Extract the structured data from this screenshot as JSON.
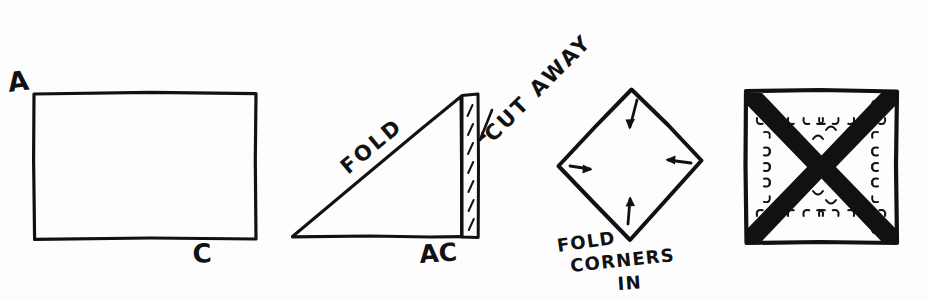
{
  "document": {
    "title": "Hand-drawn paper folding instruction sketch",
    "medium": "pen on white paper",
    "background_color": "#fdfdfd",
    "ink_color": "#111111",
    "width": 928,
    "height": 301,
    "panel_count": 4
  },
  "panels": [
    {
      "index": 1,
      "name": "rectangle-start",
      "shape": "rectangle",
      "description": "Plain rectangle of paper with corners labelled",
      "labels": [
        {
          "id": "label-a",
          "text": "A",
          "position": "top-left-outside"
        },
        {
          "id": "label-c",
          "text": "C",
          "position": "bottom-center-outside"
        }
      ]
    },
    {
      "index": 2,
      "name": "triangle-fold",
      "shape": "right-triangle",
      "description": "Rectangle folded on the diagonal forming a triangle with a leftover strip",
      "labels": [
        {
          "id": "label-fold",
          "text": "FOLD",
          "position": "along-hypotenuse",
          "rotation_deg": -40
        },
        {
          "id": "label-ac",
          "text": "AC",
          "position": "bottom-right-outside"
        },
        {
          "id": "label-cut-away",
          "text": "CUT AWAY",
          "position": "upper-right-diagonal",
          "rotation_deg": -45
        }
      ],
      "strip": {
        "name": "cut-away-strip",
        "hatching": "diagonal dashes",
        "dash_count": 7
      },
      "arrow": {
        "name": "cut-away-arrow",
        "points_to": "strip",
        "direction": "down-left"
      }
    },
    {
      "index": 3,
      "name": "diamond-fold-corners",
      "shape": "diamond",
      "description": "Square rotated 45 degrees with four arrows pointing inward",
      "labels": [
        {
          "id": "label-fold-line-1",
          "text": "FOLD",
          "rotation_deg": -8
        },
        {
          "id": "label-fold-line-2",
          "text": "CORNERS",
          "rotation_deg": -6
        },
        {
          "id": "label-fold-line-3",
          "text": "IN",
          "rotation_deg": -4
        }
      ],
      "arrows": [
        {
          "name": "arrow-top",
          "direction": "down",
          "at_vertex": "top"
        },
        {
          "name": "arrow-right",
          "direction": "left",
          "at_vertex": "right"
        },
        {
          "name": "arrow-bottom",
          "direction": "up",
          "at_vertex": "bottom"
        },
        {
          "name": "arrow-left",
          "direction": "right",
          "at_vertex": "left"
        }
      ]
    },
    {
      "index": 4,
      "name": "square-finished",
      "shape": "square",
      "description": "Finished square with a diagonal X of folded flaps, edges drawn with scalloped comb stitching marks",
      "labels": [],
      "features": {
        "diagonals": 2,
        "edge_style": "scalloped",
        "band_count": 4
      }
    }
  ]
}
